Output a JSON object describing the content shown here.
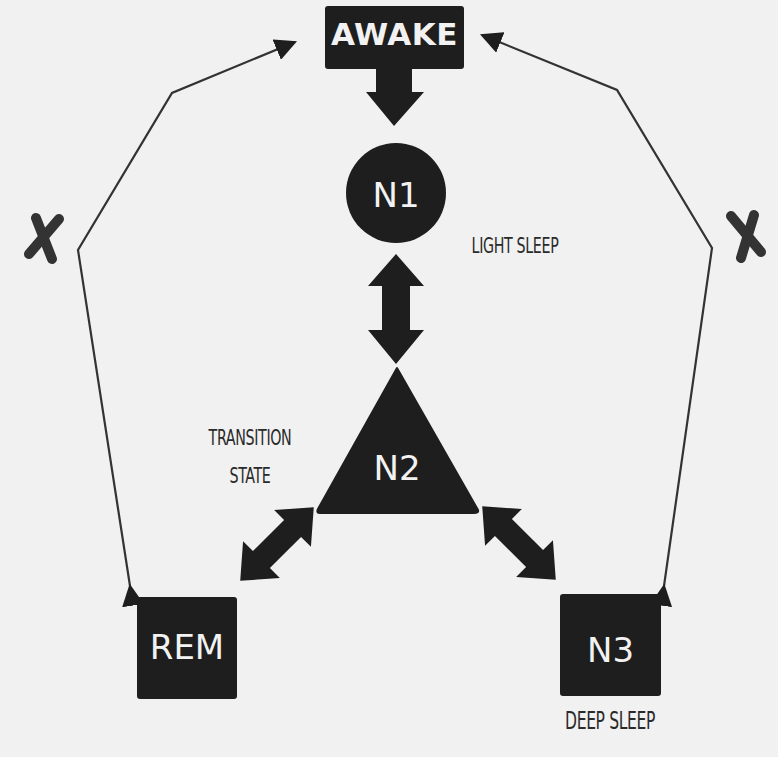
{
  "diagram": {
    "colors": {
      "background": "#f1f1f1",
      "shape_fill": "#1e1e1e",
      "thin_line": "#333333",
      "shape_text": "#f2f2f2",
      "annotation_text": "#2a2a2a"
    },
    "nodes": {
      "awake": {
        "label": "AWAKE",
        "shape": "rectangle"
      },
      "n1": {
        "label": "N1",
        "shape": "circle"
      },
      "n2": {
        "label": "N2",
        "shape": "triangle"
      },
      "rem": {
        "label": "REM",
        "shape": "square"
      },
      "n3": {
        "label": "N3",
        "shape": "square"
      }
    },
    "annotations": {
      "light_sleep": "LIGHT SLEEP",
      "transition_line1": "TRANSITION",
      "transition_line2": "STATE",
      "deep_sleep": "DEEP SLEEP"
    },
    "marks": {
      "left_x": "✗",
      "right_x": "✗"
    },
    "edges": [
      {
        "from": "AWAKE",
        "to": "N1",
        "type": "one-way thick"
      },
      {
        "from": "N1",
        "to": "N2",
        "type": "two-way thick"
      },
      {
        "from": "N2",
        "to": "REM",
        "type": "two-way thick"
      },
      {
        "from": "N2",
        "to": "N3",
        "type": "two-way thick"
      },
      {
        "from": "AWAKE",
        "to": "REM",
        "type": "two-way thin",
        "crossed": true
      },
      {
        "from": "AWAKE",
        "to": "N3",
        "type": "two-way thin",
        "crossed": true
      }
    ]
  }
}
